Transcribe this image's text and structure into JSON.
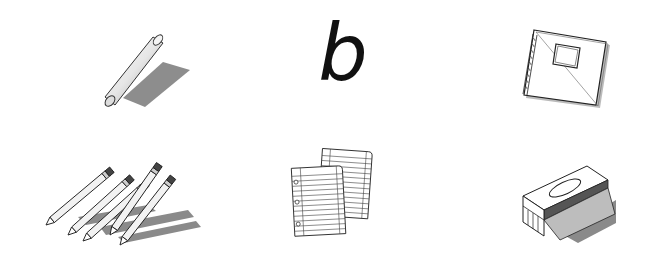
{
  "items": [
    {
      "id": "chalk",
      "label": "chalk stick"
    },
    {
      "id": "letter",
      "label": "letter b",
      "text": "b"
    },
    {
      "id": "notebook",
      "label": "spiral notebook"
    },
    {
      "id": "pencils",
      "label": "pencils",
      "count": 5
    },
    {
      "id": "paper",
      "label": "lined paper sheets",
      "count": 2
    },
    {
      "id": "eraser",
      "label": "chalkboard eraser"
    }
  ],
  "colors": {
    "background": "#ffffff",
    "ink": "#111111",
    "shadow": "#8a8a8a",
    "light_gray": "#d8d8d8"
  }
}
